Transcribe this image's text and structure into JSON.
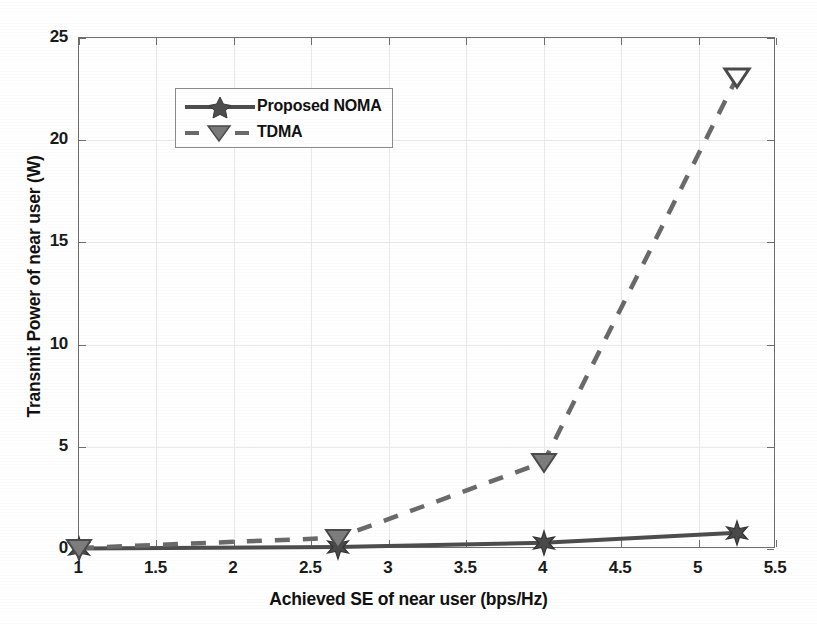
{
  "chart_data": {
    "type": "line",
    "title": "",
    "xlabel": "Achieved SE of near user (bps/Hz)",
    "ylabel": "Transmit Power of near user (W)",
    "xlim": [
      1,
      5.5
    ],
    "ylim": [
      0,
      25
    ],
    "xticks": [
      "1",
      "1.5",
      "2",
      "2.5",
      "3",
      "3.5",
      "4",
      "4.5",
      "5",
      "5.5"
    ],
    "xtick_values": [
      1,
      1.5,
      2,
      2.5,
      3,
      3.5,
      4,
      4.5,
      5,
      5.5
    ],
    "yticks": [
      "0",
      "5",
      "10",
      "15",
      "20",
      "25"
    ],
    "ytick_values": [
      0,
      5,
      10,
      15,
      20,
      25
    ],
    "grid": true,
    "legend_position": "upper left",
    "series": [
      {
        "name": "Proposed NOMA",
        "linestyle": "solid",
        "marker": "star",
        "color": "#4d4d4d",
        "x": [
          1,
          2.67,
          4,
          5.25
        ],
        "values": [
          0.02,
          0.1,
          0.3,
          0.8
        ]
      },
      {
        "name": "TDMA",
        "linestyle": "dashed",
        "marker": "triangle-down",
        "color": "#6a6a6a",
        "x": [
          1,
          2.67,
          4,
          5.25
        ],
        "values": [
          0.05,
          0.55,
          4.25,
          23.1
        ]
      }
    ]
  },
  "legend": {
    "entries": [
      {
        "label": "Proposed NOMA"
      },
      {
        "label": "TDMA"
      }
    ]
  },
  "axes": {
    "x_title": "Achieved SE of near user (bps/Hz)",
    "y_title": "Transmit Power of near user (W)",
    "x_tick_labels": [
      "1",
      "1.5",
      "2",
      "2.5",
      "3",
      "3.5",
      "4",
      "4.5",
      "5",
      "5.5"
    ],
    "y_tick_labels": [
      "0",
      "5",
      "10",
      "15",
      "20",
      "25"
    ]
  },
  "colors": {
    "axis": "#6e6e6e",
    "grid": "#e9e9e9",
    "noma": "#4d4d4d",
    "tdma": "#6a6a6a",
    "text": "#111111",
    "background": "#ffffff"
  }
}
